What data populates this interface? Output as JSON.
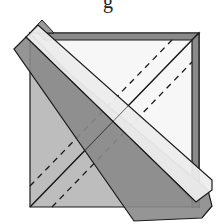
{
  "caption": "g",
  "colors": {
    "background": "#ffffff",
    "paper_white": "#f4f4f4",
    "paper_gray": "#bdbdbd",
    "paper_dark": "#8a8a8a",
    "strip_light": "#ececec",
    "outline": "#1a1a1a"
  },
  "diagram": {
    "square": {
      "x1": 30,
      "y1": 33,
      "x2": 199,
      "y2": 207
    },
    "top_band_height": 7,
    "right_band_width": 7,
    "fold_line": {
      "x1": 30,
      "y1": 207,
      "x2": 192,
      "y2": 40
    },
    "dashed_lines": [
      {
        "x1": 30,
        "y1": 186,
        "x2": 172,
        "y2": 40
      },
      {
        "x1": 52,
        "y1": 207,
        "x2": 192,
        "y2": 62
      }
    ],
    "strip": {
      "dark": [
        [
          14,
          49
        ],
        [
          26,
          37
        ],
        [
          214,
          207
        ],
        [
          203,
          219
        ],
        [
          134,
          221
        ]
      ],
      "light": [
        [
          26,
          37
        ],
        [
          38,
          25
        ],
        [
          208,
          190
        ],
        [
          196,
          202
        ]
      ]
    }
  }
}
